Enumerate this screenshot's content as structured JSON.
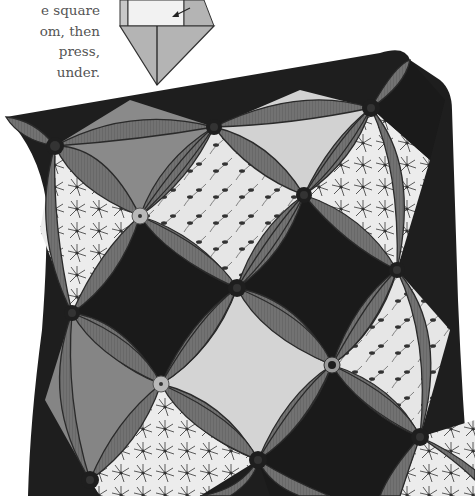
{
  "instructions": {
    "lines": [
      "e square",
      "om, then",
      "press,",
      "under."
    ]
  },
  "diagram": {
    "fill_light": "#efefef",
    "fill_mid": "#b4b4b4",
    "stroke": "#333333"
  },
  "pillow": {
    "description": "Cathedral window quilted pillow",
    "colors": {
      "petal": "#6f6f6f",
      "petal_edge": "#2e2e2e",
      "dark_window": "#1c1c1c",
      "mid_window": "#8a8a8a",
      "light_window": "#d6d6d6",
      "print_window": "#e8e8e8",
      "button_dark": "#1e1e1e",
      "button_light": "#b8b8b8"
    },
    "buttons": [
      {
        "x": 55,
        "y": 146,
        "tone": "dark"
      },
      {
        "x": 214,
        "y": 127,
        "tone": "dark"
      },
      {
        "x": 371,
        "y": 108,
        "tone": "dark"
      },
      {
        "x": 140,
        "y": 216,
        "tone": "light"
      },
      {
        "x": 304,
        "y": 195,
        "tone": "dark"
      },
      {
        "x": 237,
        "y": 288,
        "tone": "dark"
      },
      {
        "x": 72,
        "y": 313,
        "tone": "dark"
      },
      {
        "x": 397,
        "y": 270,
        "tone": "dark"
      },
      {
        "x": 161,
        "y": 384,
        "tone": "light"
      },
      {
        "x": 332,
        "y": 365,
        "tone": "ring"
      },
      {
        "x": 258,
        "y": 460,
        "tone": "dark"
      },
      {
        "x": 420,
        "y": 437,
        "tone": "dark"
      },
      {
        "x": 90,
        "y": 480,
        "tone": "dark"
      }
    ]
  }
}
